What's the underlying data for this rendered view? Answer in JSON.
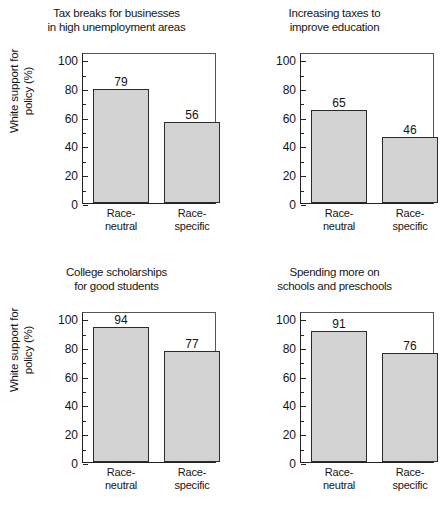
{
  "figure": {
    "shared_ylabel": [
      "White support for",
      "policy (%)"
    ],
    "categories": [
      "Race-neutral",
      "Race-specific"
    ],
    "category_lines": [
      [
        "Race-",
        "neutral"
      ],
      [
        "Race-",
        "specific"
      ]
    ],
    "yticks": [
      0,
      20,
      40,
      60,
      80,
      100
    ],
    "ytick_labels": [
      "0",
      "20",
      "40",
      "60",
      "80",
      "100"
    ],
    "yminor": [
      10,
      30,
      50,
      70,
      90
    ],
    "ylim": [
      0,
      105
    ],
    "bar_fill": "#d2d2d2",
    "bar_edge": "#2b2b2b",
    "axis_color": "#222222"
  },
  "chart_data": [
    {
      "type": "bar",
      "title": "Tax breaks for businesses in high unemployment areas",
      "title_lines": [
        "Tax breaks for businesses",
        "in high unemployment areas"
      ],
      "categories": [
        "Race-neutral",
        "Race-specific"
      ],
      "values": [
        79,
        56
      ],
      "value_labels": [
        "79",
        "56"
      ],
      "xlabel": "",
      "ylabel": "White support for policy (%)",
      "ylim": [
        0,
        105
      ],
      "yticks": [
        0,
        20,
        40,
        60,
        80,
        100
      ],
      "grid": false,
      "legend": "none"
    },
    {
      "type": "bar",
      "title": "Increasing taxes to improve education",
      "title_lines": [
        "Increasing taxes to",
        "improve education"
      ],
      "categories": [
        "Race-neutral",
        "Race-specific"
      ],
      "values": [
        65,
        46
      ],
      "value_labels": [
        "65",
        "46"
      ],
      "xlabel": "",
      "ylabel": "",
      "ylim": [
        0,
        105
      ],
      "yticks": [
        0,
        20,
        40,
        60,
        80,
        100
      ],
      "grid": false,
      "legend": "none"
    },
    {
      "type": "bar",
      "title": "College scholarships for good students",
      "title_lines": [
        "College scholarships",
        "for good students"
      ],
      "categories": [
        "Race-neutral",
        "Race-specific"
      ],
      "values": [
        94,
        77
      ],
      "value_labels": [
        "94",
        "77"
      ],
      "xlabel": "",
      "ylabel": "White support for policy (%)",
      "ylim": [
        0,
        105
      ],
      "yticks": [
        0,
        20,
        40,
        60,
        80,
        100
      ],
      "grid": false,
      "legend": "none"
    },
    {
      "type": "bar",
      "title": "Spending more on schools and preschools",
      "title_lines": [
        "Spending more on",
        "schools and preschools"
      ],
      "categories": [
        "Race-neutral",
        "Race-specific"
      ],
      "values": [
        91,
        76
      ],
      "value_labels": [
        "91",
        "76"
      ],
      "xlabel": "",
      "ylabel": "",
      "ylim": [
        0,
        105
      ],
      "yticks": [
        0,
        20,
        40,
        60,
        80,
        100
      ],
      "grid": false,
      "legend": "none"
    }
  ]
}
